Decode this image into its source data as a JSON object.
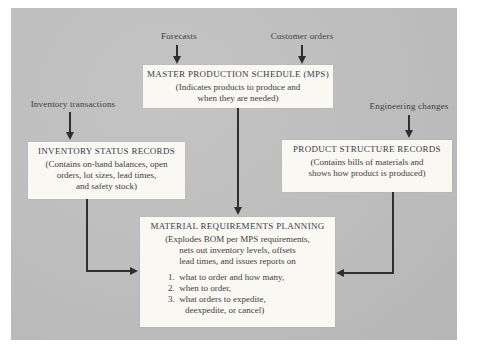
{
  "labels": {
    "forecasts": "Forecasts",
    "customer_orders": "Customer orders",
    "inventory_transactions": "Inventory transactions",
    "engineering_changes": "Engineering changes"
  },
  "boxes": {
    "mps": {
      "title": "MASTER PRODUCTION SCHEDULE (MPS)",
      "lines": [
        "(Indicates products to produce and",
        "when they are needed)"
      ]
    },
    "inventory": {
      "title": "INVENTORY STATUS RECORDS",
      "lines": [
        "(Contains on-hand balances, open",
        "orders, lot sizes, lead times,",
        "and safety stock)"
      ]
    },
    "product": {
      "title": "PRODUCT STRUCTURE RECORDS",
      "lines": [
        "(Contains bills of materials and",
        "shows how product is produced)"
      ]
    },
    "mrp": {
      "title": "MATERIAL REQUIREMENTS PLANNING",
      "lines": [
        "(Explodes BOM per MPS requirements,",
        "nets out inventory levels, offsets",
        "lead times, and issues reports on"
      ],
      "list": [
        "1.  what to order and how many,",
        "2.  when to order,",
        "3.  what orders to expedite,"
      ],
      "list_continuation": "deexpedite, or cancel)"
    }
  },
  "colors": {
    "panel": "#bdbdbd",
    "box_bg": "#faf8f3",
    "line": "#2f2f2f",
    "heading_text": "#38384a",
    "body_text": "#413d3b"
  }
}
